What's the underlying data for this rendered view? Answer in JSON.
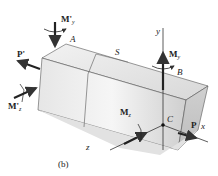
{
  "figure": {
    "caption": "(b)",
    "labels": {
      "My_prime": "M'",
      "My_prime_sub": "y",
      "P_prime": "P'",
      "Mz_prime": "M'",
      "Mz_prime_sub": "z",
      "A": "A",
      "S": "S",
      "y_axis": "y",
      "My": "M",
      "My_sub": "y",
      "B": "B",
      "C": "C",
      "P": "P",
      "Mz": "M",
      "Mz_sub": "z",
      "z_axis": "z",
      "x_axis": "x"
    }
  }
}
